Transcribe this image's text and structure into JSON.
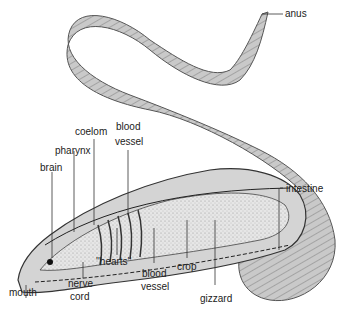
{
  "diagram": {
    "labels": {
      "anus": "anus",
      "coelom": "coelom",
      "blood_vessel_top_1": "blood",
      "blood_vessel_top_2": "vessel",
      "pharynx": "pharynx",
      "brain": "brain",
      "intestine": "intestine",
      "mouth": "mouth",
      "nerve_cord_1": "nerve",
      "nerve_cord_2": "cord",
      "hearts": "''hearts''",
      "blood_vessel_bottom_1": "blood",
      "blood_vessel_bottom_2": "vessel",
      "crop": "crop",
      "gizzard": "gizzard"
    }
  }
}
